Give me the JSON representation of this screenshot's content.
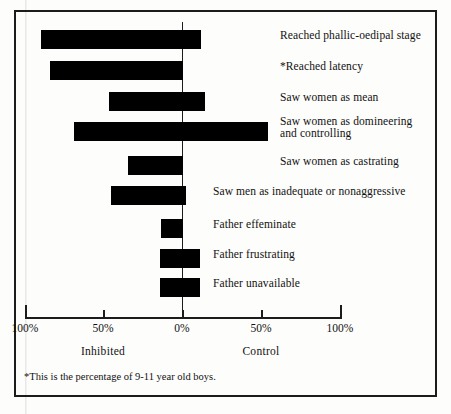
{
  "chart_data": {
    "type": "bar",
    "orientation": "horizontal",
    "title": "",
    "xlabel": "",
    "ylabel": "",
    "xlim": [
      -100,
      100
    ],
    "grid": false,
    "zero_line": true,
    "axis_note": "Diverging bar chart; left side = Inhibited, right side = Control",
    "tick_labels": [
      "100%",
      "50%",
      "0%",
      "50%",
      "100%"
    ],
    "tick_values": [
      -100,
      -50,
      0,
      50,
      100
    ],
    "group_labels": [
      "Inhibited",
      "Control"
    ],
    "footnote": "*This is the percentage of 9-11 year old boys.",
    "categories": [
      "Reached phallic-oedipal stage",
      "*Reached latency",
      "Saw women as mean",
      "Saw women as domineering\nand controlling",
      "Saw women as castrating",
      "Saw men as inadequate or nonaggressive",
      "Father effeminate",
      "Father frustrating",
      "Father unavailable"
    ],
    "bars": [
      {
        "label": "Reached phallic-oedipal stage",
        "inhibited": 90,
        "control": 12
      },
      {
        "label": "*Reached latency",
        "inhibited": 85,
        "control": 0
      },
      {
        "label": "Saw women as mean",
        "inhibited": 47,
        "control": 15
      },
      {
        "label": "Saw women as domineering\nand controlling",
        "inhibited": 69,
        "control": 55
      },
      {
        "label": "Saw women as castrating",
        "inhibited": 35,
        "control": 0
      },
      {
        "label": "Saw men as inadequate or nonaggressive",
        "inhibited": 45,
        "control": 2
      },
      {
        "label": "Father effeminate",
        "inhibited": 13,
        "control": 0
      },
      {
        "label": "Father frustrating",
        "inhibited": 14,
        "control": 11
      },
      {
        "label": "Father unavailable",
        "inhibited": 14,
        "control": 11
      }
    ],
    "series": [
      {
        "name": "Inhibited",
        "values": [
          90,
          85,
          47,
          69,
          35,
          45,
          13,
          14,
          14
        ]
      },
      {
        "name": "Control",
        "values": [
          12,
          0,
          15,
          55,
          0,
          2,
          0,
          11,
          11
        ]
      }
    ],
    "colors": {
      "bar": "#000000",
      "axis": "#1c1c1c",
      "text": "#111111",
      "background": "#fdfdfb"
    }
  },
  "ticks": [
    {
      "label": "100%",
      "x": 25
    },
    {
      "label": "50%",
      "x": 103
    },
    {
      "label": "0%",
      "x": 182
    },
    {
      "label": "50%",
      "x": 261
    },
    {
      "label": "100%",
      "x": 340
    }
  ],
  "groups": [
    {
      "label": "Inhibited",
      "x": 103
    },
    {
      "label": "Control",
      "x": 261
    }
  ],
  "rows": [
    {
      "label": "Reached phallic-oedipal stage",
      "top": 26,
      "left": 41,
      "width": 160,
      "label_x": 280,
      "label_top": 3
    },
    {
      "label": "*Reached latency",
      "top": 57,
      "left": 50,
      "width": 133,
      "label_x": 280,
      "label_top": 3
    },
    {
      "label": "Saw women as mean",
      "top": 88,
      "left": 109,
      "width": 96,
      "label_x": 280,
      "label_top": 3
    },
    {
      "label": "Saw women as domineering\nand controlling",
      "top": 118,
      "left": 74,
      "width": 194,
      "label_x": 280,
      "label_top": -3
    },
    {
      "label": "Saw women as castrating",
      "top": 152,
      "left": 128,
      "width": 55,
      "label_x": 280,
      "label_top": 3
    },
    {
      "label": "Saw men as inadequate or nonaggressive",
      "top": 182,
      "left": 111,
      "width": 75,
      "label_x": 213,
      "label_top": 3
    },
    {
      "label": "Father effeminate",
      "top": 215,
      "left": 161,
      "width": 22,
      "label_x": 213,
      "label_top": 3
    },
    {
      "label": "Father frustrating",
      "top": 245,
      "left": 160,
      "width": 40,
      "label_x": 213,
      "label_top": 3
    },
    {
      "label": "Father unavailable",
      "top": 274,
      "left": 160,
      "width": 40,
      "label_x": 213,
      "label_top": 3
    }
  ],
  "footnote": "*This is the percentage of 9-11 year old boys."
}
